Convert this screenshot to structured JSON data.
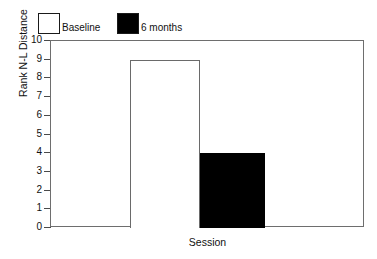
{
  "chart_data": {
    "type": "bar",
    "title": "",
    "xlabel": "Session",
    "ylabel": "Rank N-L Distance",
    "categories": [
      "Session"
    ],
    "ylim": [
      0,
      10
    ],
    "yticks": [
      0,
      1,
      2,
      3,
      4,
      5,
      6,
      7,
      8,
      9,
      10
    ],
    "ytick_labels": [
      "0",
      "1",
      "2",
      "3",
      "4",
      "5",
      "6",
      "7",
      "8",
      "9",
      "10"
    ],
    "grid": false,
    "legend_position": "above-plot-left",
    "series": [
      {
        "name": "Baseline",
        "values": [
          9
        ],
        "color": "#ffffff",
        "edge_color": "#6a6a6a",
        "swatch": "hollow"
      },
      {
        "name": "6 months",
        "values": [
          4
        ],
        "color": "#000000",
        "edge_color": "#000000",
        "swatch": "filled"
      }
    ]
  },
  "legend": {
    "entries": [
      {
        "label": "Baseline"
      },
      {
        "label": "6 months"
      }
    ]
  },
  "colors": {
    "background": "#ffffff",
    "frame": "#6e6e6e",
    "text": "#111111",
    "tick": "#4a4a4a",
    "bar_filled": "#000000",
    "bar_hollow": "#ffffff"
  }
}
